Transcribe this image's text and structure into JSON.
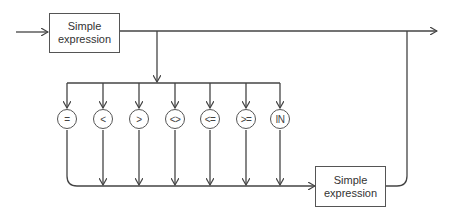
{
  "diagram": {
    "type": "syntax-diagram",
    "boxes": [
      {
        "id": "top",
        "line1": "Simple",
        "line2": "expression"
      },
      {
        "id": "bottom",
        "line1": "Simple",
        "line2": "expression"
      }
    ],
    "operators": [
      "=",
      "<",
      ">",
      "<>",
      "<=",
      ">=",
      "IN"
    ],
    "colors": {
      "line": "#444444",
      "background": "#ffffff"
    }
  }
}
